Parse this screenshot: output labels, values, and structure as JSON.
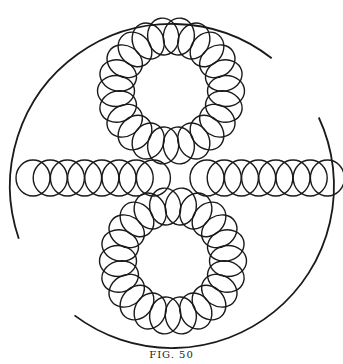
{
  "caption": "FIG. 50",
  "figure": {
    "stroke_color": "#1a1a1a",
    "background_color": "#ffffff",
    "rings": [
      {
        "name": "top-ring",
        "ellipse_count": 22
      },
      {
        "name": "bottom-ring",
        "ellipse_count": 22
      }
    ],
    "chains": [
      {
        "name": "left-chain",
        "ellipse_count": 8
      },
      {
        "name": "right-chain",
        "ellipse_count": 8
      }
    ],
    "outer_circle": {
      "segments": 2
    }
  }
}
